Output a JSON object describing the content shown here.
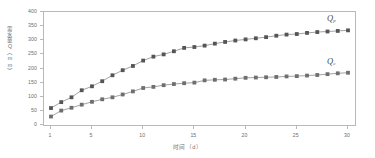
{
  "chart_data": {
    "type": "line",
    "title": "",
    "xlabel": "时间（d）",
    "ylabel": "需水量Q（mm）",
    "xlim": [
      1,
      30
    ],
    "ylim": [
      0,
      400
    ],
    "xticks": [
      1,
      5,
      10,
      15,
      20,
      25,
      30
    ],
    "yticks": [
      0,
      50,
      100,
      150,
      200,
      250,
      300,
      350,
      400
    ],
    "grid": false,
    "legend_position": "inline-right",
    "x": [
      1,
      2,
      3,
      4,
      5,
      6,
      7,
      8,
      9,
      10,
      11,
      12,
      13,
      14,
      15,
      16,
      17,
      18,
      19,
      20,
      21,
      22,
      23,
      24,
      25,
      26,
      27,
      28,
      29,
      30
    ],
    "series": [
      {
        "name": "Q_p",
        "label": "Q",
        "sublabel": "p",
        "marker": "square",
        "color": "#555555",
        "line_color": "#8a8a8a",
        "values": [
          60,
          81,
          98,
          123,
          137,
          155,
          176,
          194,
          209,
          228,
          242,
          250,
          261,
          273,
          276,
          281,
          288,
          294,
          299,
          303,
          307,
          311,
          316,
          320,
          322,
          326,
          329,
          331,
          333,
          335
        ]
      },
      {
        "name": "Q_c",
        "label": "Q",
        "sublabel": "c",
        "marker": "square",
        "color": "#6f6f6f",
        "line_color": "#8a8a8a",
        "values": [
          30,
          51,
          61,
          72,
          82,
          91,
          98,
          108,
          119,
          131,
          135,
          141,
          145,
          148,
          150,
          158,
          160,
          161,
          164,
          167,
          168,
          169,
          170,
          172,
          173,
          175,
          177,
          180,
          183,
          185
        ]
      }
    ]
  }
}
